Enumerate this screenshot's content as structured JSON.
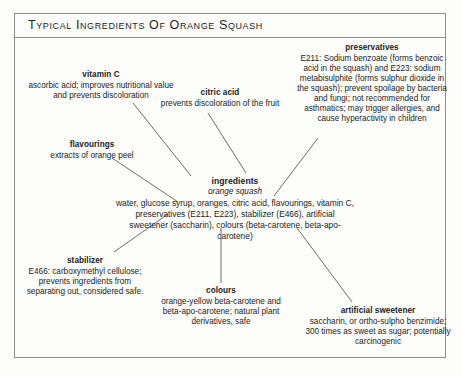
{
  "title": "Typical Ingredients Of Orange Squash",
  "colors": {
    "border": "#8e8e8e",
    "line": "#5a5a5a",
    "text": "#1b1b1b",
    "background": "#fdfdfc"
  },
  "nodes": {
    "vitamin_c": {
      "heading": "vitamin C",
      "body": "ascorbic acid; improves nutritional value and prevents discoloration"
    },
    "citric_acid": {
      "heading": "citric acid",
      "body": "prevents discoloration of the fruit"
    },
    "preservatives": {
      "heading": "preservatives",
      "body": "E211: Sodium benzoate (forms benzoic acid in the squash) and E223: sodium metabisulphite (forms sulphur dioxide in the squash); prevent spoilage by bacteria and fungi; not recommended for asthmatics; may trigger allergies, and cause hyperactivity in children"
    },
    "flavourings": {
      "heading": "flavourings",
      "body": "extracts of orange peel"
    },
    "ingredients": {
      "heading": "ingredients",
      "subheading": "orange squash",
      "body": "water, glucose syrup, oranges, citric acid, flavourings, vitamin C, preservatives (E211, E223), stabilizer (E466), artificial sweetener (saccharin), colours (beta-carotene, beta-apo-carotene)"
    },
    "stabilizer": {
      "heading": "stabilizer",
      "body": "E466: carboxymethyl cellulose; prevents ingredients from separating out, considered safe."
    },
    "colours": {
      "heading": "colours",
      "body": "orange-yellow beta-carotene and beta-apo-carotene; natural plant derivatives, safe"
    },
    "artificial_sweetener": {
      "heading": "artificial sweetener",
      "body": "saccharin, or ortho-sulpho benzimide; 300 times as sweet as sugar; potentially carcinogenic"
    }
  }
}
